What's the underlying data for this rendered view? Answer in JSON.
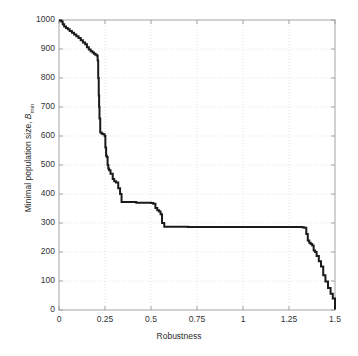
{
  "chart_data": {
    "type": "line",
    "title": "",
    "subtitle": "",
    "xlabel": "Robustness",
    "ylabel_prefix": "Minimal population size, ",
    "ylabel_symbol": "B",
    "ylabel_subscript": "min",
    "xlim": [
      0,
      1.5
    ],
    "ylim": [
      0,
      1000
    ],
    "xticks": [
      0,
      0.25,
      0.5,
      0.75,
      1,
      1.25,
      1.5
    ],
    "xticklabels": [
      "0",
      "0.25",
      "0.5",
      "0.75",
      "1",
      "1.25",
      "1.5"
    ],
    "yticks": [
      0,
      100,
      200,
      300,
      400,
      500,
      600,
      700,
      800,
      900,
      1000
    ],
    "yticklabels": [
      "0",
      "100",
      "200",
      "300",
      "400",
      "500",
      "600",
      "700",
      "800",
      "900",
      "1000"
    ],
    "grid": true,
    "grid_style": "dotted",
    "grid_color": "#d9d9d9",
    "legend": null,
    "line_color": "#1a1a1a",
    "line_width": 2.0,
    "drawstyle": "steps-post",
    "series": [
      {
        "name": "Minimal population size",
        "x": [
          0.0,
          0.012,
          0.02,
          0.028,
          0.038,
          0.048,
          0.058,
          0.07,
          0.082,
          0.094,
          0.106,
          0.118,
          0.13,
          0.142,
          0.152,
          0.162,
          0.172,
          0.182,
          0.19,
          0.198,
          0.205,
          0.21,
          0.213,
          0.216,
          0.218,
          0.22,
          0.224,
          0.232,
          0.24,
          0.248,
          0.252,
          0.256,
          0.26,
          0.264,
          0.268,
          0.272,
          0.28,
          0.292,
          0.3,
          0.31,
          0.322,
          0.332,
          0.34,
          0.42,
          0.5,
          0.512,
          0.524,
          0.534,
          0.544,
          0.552,
          0.56,
          0.572,
          0.7,
          0.9,
          1.1,
          1.25,
          1.32,
          1.332,
          1.344,
          1.352,
          1.36,
          1.368,
          1.376,
          1.384,
          1.392,
          1.4,
          1.412,
          1.424,
          1.436,
          1.448,
          1.462,
          1.476,
          1.488,
          1.5
        ],
        "y": [
          998,
          995,
          985,
          978,
          972,
          968,
          962,
          956,
          950,
          944,
          938,
          930,
          922,
          916,
          906,
          898,
          892,
          888,
          884,
          880,
          878,
          860,
          800,
          740,
          700,
          660,
          612,
          608,
          606,
          600,
          560,
          532,
          528,
          500,
          488,
          482,
          470,
          452,
          444,
          440,
          420,
          400,
          372,
          370,
          369,
          366,
          352,
          344,
          340,
          330,
          300,
          287,
          286,
          286,
          286,
          286,
          285,
          284,
          262,
          240,
          232,
          228,
          222,
          205,
          200,
          186,
          168,
          150,
          120,
          98,
          76,
          56,
          40,
          2
        ]
      }
    ],
    "annotations": []
  }
}
